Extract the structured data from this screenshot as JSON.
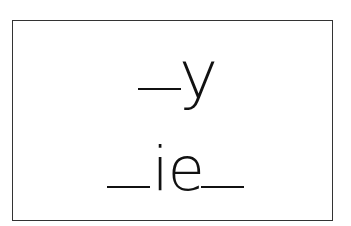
{
  "card": {
    "line1": {
      "blank": "__",
      "letters": "y"
    },
    "line2": {
      "leading_blank": "__",
      "letters": "ie",
      "trailing_blank": "__"
    }
  },
  "colors": {
    "ink": "#111111",
    "border": "#333333",
    "background": "#ffffff"
  }
}
